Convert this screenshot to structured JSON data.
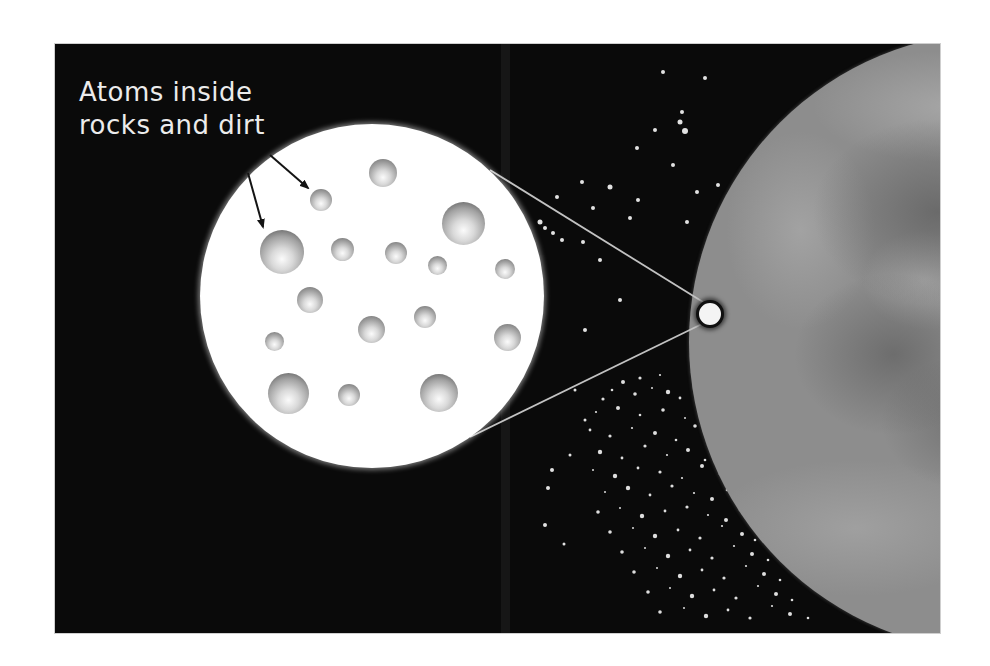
{
  "figure": {
    "canvas": {
      "w": 990,
      "h": 666,
      "background": "#ffffff"
    },
    "frame": {
      "x": 55,
      "y": 44,
      "w": 885,
      "h": 589,
      "bg": "#0a0a0a"
    },
    "label": {
      "line1": "Atoms inside",
      "line2": "rocks and dirt",
      "color": "#ececec"
    },
    "zoom_circle": {
      "cx": 317,
      "cy": 252,
      "r": 172,
      "fill": "#ffffff"
    },
    "atom_colors": {
      "highlight": "#fbfbfb",
      "mid": "#d9d9d9",
      "shade": "#a2a2a2",
      "rim": "#707070",
      "rim_large": "#5a5a5a"
    },
    "atoms": [
      [
        183,
        49,
        14
      ],
      [
        121,
        76,
        11
      ],
      [
        263,
        99,
        21.5
      ],
      [
        82,
        128,
        22
      ],
      [
        142,
        125,
        11.5
      ],
      [
        196,
        129,
        11
      ],
      [
        237,
        141,
        9.5
      ],
      [
        305,
        145,
        10
      ],
      [
        110,
        176,
        13
      ],
      [
        171,
        205,
        13.5
      ],
      [
        225,
        193,
        11
      ],
      [
        307,
        213,
        13.5
      ],
      [
        74,
        217,
        9.5
      ],
      [
        88,
        269,
        20.5
      ],
      [
        149,
        271,
        11
      ],
      [
        239,
        269,
        19
      ]
    ],
    "arrows": {
      "color": "#141414",
      "lines": [
        {
          "x1": 215,
          "y1": 111,
          "x2": 253,
          "y2": 144
        },
        {
          "x1": 193,
          "y1": 129,
          "x2": 208,
          "y2": 183
        }
      ]
    },
    "connectors": {
      "color": "#c2c2c2",
      "lines": [
        {
          "x1": 435,
          "y1": 126,
          "x2": 648,
          "y2": 258
        },
        {
          "x1": 415,
          "y1": 393,
          "x2": 647,
          "y2": 280
        }
      ]
    },
    "detail_circle": {
      "cx": 655,
      "cy": 270,
      "r": 14
    },
    "planet": {
      "cx": 944,
      "cy": 298,
      "r": 310,
      "base": "#8d8d8d",
      "dark": "#4e4e4e",
      "light": "#c2c2c2"
    },
    "scan_band": {
      "x": 446,
      "w": 9
    },
    "stars": {
      "color": "#f5f5f5",
      "sparse": [
        [
          608,
          28,
          2
        ],
        [
          650,
          34,
          2
        ],
        [
          627,
          68,
          2
        ],
        [
          625,
          78,
          2.5
        ],
        [
          600,
          86,
          2
        ],
        [
          630,
          87,
          3
        ],
        [
          582,
          104,
          2
        ],
        [
          618,
          121,
          2
        ],
        [
          527,
          138,
          2
        ],
        [
          555,
          143,
          2.5
        ],
        [
          663,
          141,
          2
        ],
        [
          642,
          148,
          2
        ],
        [
          502,
          153,
          2
        ],
        [
          583,
          156,
          2
        ],
        [
          538,
          164,
          2
        ],
        [
          575,
          174,
          2
        ],
        [
          485,
          178,
          2.5
        ],
        [
          490,
          184,
          2
        ],
        [
          498,
          189,
          2
        ],
        [
          507,
          196,
          2
        ],
        [
          528,
          198,
          2
        ],
        [
          632,
          178,
          2
        ],
        [
          675,
          201,
          2
        ],
        [
          545,
          216,
          2
        ],
        [
          565,
          256,
          2
        ],
        [
          530,
          286,
          2
        ],
        [
          497,
          426,
          2
        ],
        [
          493,
          444,
          2
        ],
        [
          490,
          481,
          2
        ],
        [
          509,
          500,
          1.5
        ],
        [
          520,
          346,
          1.5
        ],
        [
          530,
          376,
          1.5
        ],
        [
          515,
          411,
          1.5
        ]
      ],
      "cluster_sizes": [
        1.6,
        1.1,
        2.0,
        1.3,
        1.8,
        1.0,
        2.2,
        1.4
      ],
      "cluster": [
        [
          585,
          334
        ],
        [
          605,
          331
        ],
        [
          568,
          338
        ],
        [
          557,
          346
        ],
        [
          580,
          350
        ],
        [
          597,
          344
        ],
        [
          613,
          348
        ],
        [
          625,
          354
        ],
        [
          548,
          355
        ],
        [
          541,
          368
        ],
        [
          563,
          364
        ],
        [
          585,
          371
        ],
        [
          608,
          366
        ],
        [
          630,
          374
        ],
        [
          645,
          363
        ],
        [
          535,
          386
        ],
        [
          555,
          392
        ],
        [
          577,
          384
        ],
        [
          600,
          389
        ],
        [
          621,
          396
        ],
        [
          640,
          382
        ],
        [
          652,
          393
        ],
        [
          545,
          408
        ],
        [
          567,
          414
        ],
        [
          590,
          402
        ],
        [
          612,
          411
        ],
        [
          633,
          406
        ],
        [
          650,
          416
        ],
        [
          662,
          404
        ],
        [
          538,
          426
        ],
        [
          560,
          432
        ],
        [
          583,
          424
        ],
        [
          605,
          428
        ],
        [
          627,
          434
        ],
        [
          647,
          422
        ],
        [
          665,
          430
        ],
        [
          675,
          436
        ],
        [
          550,
          448
        ],
        [
          573,
          444
        ],
        [
          595,
          451
        ],
        [
          617,
          442
        ],
        [
          639,
          449
        ],
        [
          657,
          455
        ],
        [
          672,
          446
        ],
        [
          543,
          468
        ],
        [
          565,
          464
        ],
        [
          587,
          472
        ],
        [
          610,
          467
        ],
        [
          632,
          463
        ],
        [
          653,
          471
        ],
        [
          671,
          476
        ],
        [
          685,
          466
        ],
        [
          555,
          488
        ],
        [
          578,
          484
        ],
        [
          600,
          492
        ],
        [
          623,
          486
        ],
        [
          645,
          494
        ],
        [
          667,
          482
        ],
        [
          687,
          490
        ],
        [
          700,
          496
        ],
        [
          567,
          508
        ],
        [
          590,
          504
        ],
        [
          613,
          512
        ],
        [
          635,
          506
        ],
        [
          657,
          514
        ],
        [
          679,
          502
        ],
        [
          697,
          510
        ],
        [
          713,
          516
        ],
        [
          579,
          528
        ],
        [
          602,
          524
        ],
        [
          625,
          532
        ],
        [
          647,
          526
        ],
        [
          669,
          534
        ],
        [
          691,
          522
        ],
        [
          709,
          530
        ],
        [
          725,
          536
        ],
        [
          593,
          548
        ],
        [
          615,
          544
        ],
        [
          637,
          552
        ],
        [
          659,
          546
        ],
        [
          681,
          554
        ],
        [
          703,
          542
        ],
        [
          721,
          550
        ],
        [
          737,
          556
        ],
        [
          605,
          568
        ],
        [
          629,
          564
        ],
        [
          651,
          572
        ],
        [
          673,
          566
        ],
        [
          695,
          574
        ],
        [
          717,
          562
        ],
        [
          735,
          570
        ],
        [
          753,
          574
        ]
      ]
    }
  }
}
